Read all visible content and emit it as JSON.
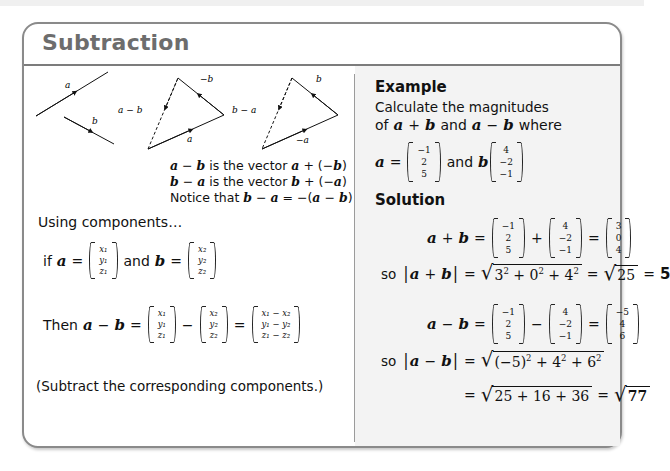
{
  "card": {
    "title": "Subtraction"
  },
  "left": {
    "diagram": {
      "labels": {
        "a": "a",
        "b": "b",
        "neg_b": "−b",
        "neg_a": "−a",
        "a_minus_b": "a − b",
        "b_minus_a": "b − a"
      }
    },
    "notes": [
      "a − b is the vector a + (−b)",
      "b − a is the vector b + (−a)",
      "Notice that b − a = −(a − b)"
    ],
    "using_components": "Using components…",
    "if_line": {
      "prefix": "if",
      "a_symbol": "a",
      "equals": "=",
      "a_components": [
        "x₁",
        "y₁",
        "z₁"
      ],
      "and_word": "and",
      "b_symbol": "b",
      "b_components": [
        "x₂",
        "y₂",
        "z₂"
      ]
    },
    "then_line": {
      "prefix": "Then",
      "a_symbol": "a",
      "minus": "−",
      "b_symbol": "b",
      "equals": "=",
      "a_components": [
        "x₁",
        "y₁",
        "z₁"
      ],
      "b_components": [
        "x₂",
        "y₂",
        "z₂"
      ],
      "result_components": [
        "x₁ − x₂",
        "y₁ − y₂",
        "z₁ − z₂"
      ]
    },
    "subtract_note": "(Subtract the corresponding components.)"
  },
  "right": {
    "example_heading": "Example",
    "example_line1": "Calculate the magnitudes",
    "example_line2": {
      "of": "of",
      "a": "a",
      "plus": "+",
      "b": "b",
      "and": "and",
      "a2": "a",
      "minus": "−",
      "b2": "b",
      "where": "where"
    },
    "given": {
      "a_symbol": "a",
      "equals": "=",
      "a_components": [
        "−1",
        "2",
        "5"
      ],
      "and_word": "and",
      "b_symbol": "b",
      "b_components": [
        "4",
        "−2",
        "−1"
      ]
    },
    "solution_heading": "Solution",
    "sum_line": {
      "a": "a",
      "plus": "+",
      "b": "b",
      "equals": "=",
      "a_components": [
        "−1",
        "2",
        "5"
      ],
      "op": "+",
      "b_components": [
        "4",
        "−2",
        "−1"
      ],
      "eq2": "=",
      "result_components": [
        "3",
        "0",
        "4"
      ]
    },
    "sum_magnitude": {
      "so": "so",
      "abs_open": "|",
      "a": "a",
      "plus": "+",
      "b": "b",
      "abs_close": "|",
      "equals": "=",
      "radicand": "3² + 0² + 4²",
      "radicand_terms": [
        "3",
        "0",
        "4"
      ],
      "eq2": "=",
      "radicand2": "25",
      "eq3": "=",
      "result": "5"
    },
    "diff_line": {
      "a": "a",
      "minus": "−",
      "b": "b",
      "equals": "=",
      "a_components": [
        "−1",
        "2",
        "5"
      ],
      "op": "−",
      "b_components": [
        "4",
        "−2",
        "−1"
      ],
      "eq2": "=",
      "result_components": [
        "−5",
        "4",
        "6"
      ]
    },
    "diff_magnitude": {
      "so": "so",
      "abs_open": "|",
      "a": "a",
      "minus": "−",
      "b": "b",
      "abs_close": "|",
      "equals": "=",
      "radicand_terms": [
        "(−5)",
        "4",
        "6"
      ]
    },
    "diff_magnitude_cont": {
      "equals": "=",
      "radicand": "25 + 16 + 36",
      "eq2": "=",
      "result_radicand": "77"
    }
  },
  "colors": {
    "title": "#6d6d6d",
    "border": "#8a8a8a",
    "panel_bg": "#f3f3f3",
    "text": "#111111"
  }
}
